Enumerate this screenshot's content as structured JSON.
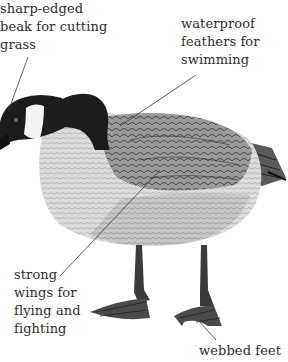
{
  "diagram": {
    "labels": [
      {
        "id": "beak",
        "text": "sharp-edged\nbeak for cutting\ngrass"
      },
      {
        "id": "feathers",
        "text": "waterproof\nfeathers for\nswimming"
      },
      {
        "id": "wings",
        "text": "strong\nwings for\nflying and\nfighting"
      },
      {
        "id": "feet",
        "text": "webbed feet"
      }
    ]
  },
  "colors": {
    "background": "#ffffff",
    "text": "#2e2e2e",
    "leader_line": "#3a3a3a",
    "head_neck": "#1c1c1c",
    "cheek_patch": "#f4f4f4",
    "breast": "#d8d8d8",
    "back_wing": "#8a8a8a",
    "legs": "#3b3b3b"
  }
}
